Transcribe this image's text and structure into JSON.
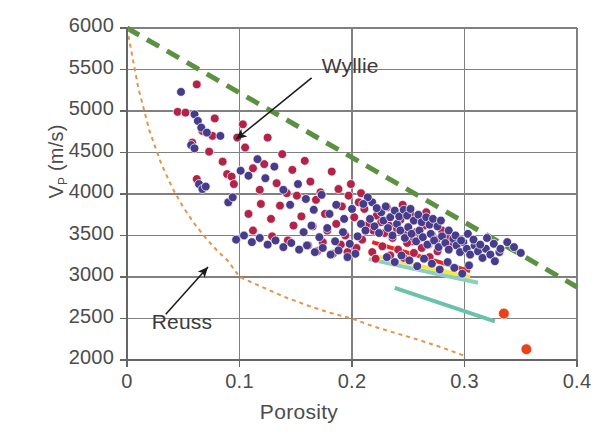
{
  "chart_data": {
    "type": "scatter",
    "title": "",
    "xlabel": "Porosity",
    "ylabel": "V_p (m/s)",
    "ylabel_main": "V",
    "ylabel_sub": "P",
    "ylabel_units": " (m/s)",
    "xlim": [
      0,
      0.4
    ],
    "ylim": [
      2000,
      6000
    ],
    "grid": true,
    "legend": "none",
    "xticks": [
      "0",
      "0.1",
      "0.2",
      "0.3",
      "0.4"
    ],
    "xtick_values": [
      0,
      0.1,
      0.2,
      0.3,
      0.4
    ],
    "yticks": [
      "2000",
      "2500",
      "3000",
      "3500",
      "4000",
      "4500",
      "5000",
      "5500",
      "6000"
    ],
    "ytick_values": [
      2000,
      2500,
      3000,
      3500,
      4000,
      4500,
      5000,
      5500,
      6000
    ],
    "annotations": [
      {
        "label": "Wyllie",
        "text_x": 0.173,
        "text_y": 5520,
        "arrow_to_x": 0.097,
        "arrow_to_y": 4660
      },
      {
        "label": "Reuss",
        "text_x": 0.022,
        "text_y": 2430,
        "arrow_to_x": 0.072,
        "arrow_to_y": 3120
      }
    ],
    "series": [
      {
        "name": "Wyllie time-average",
        "style": "dashed-line",
        "color": "#5a9142",
        "linewidth": 5,
        "dash": "14,9",
        "points": [
          [
            0.0,
            6000
          ],
          [
            0.4,
            2880
          ]
        ]
      },
      {
        "name": "Reuss bound",
        "style": "dotted-line",
        "color": "#E3954E",
        "linewidth": 2,
        "dash": "4,4",
        "points": [
          [
            0.0,
            6000
          ],
          [
            0.01,
            5280
          ],
          [
            0.02,
            4760
          ],
          [
            0.03,
            4380
          ],
          [
            0.04,
            4080
          ],
          [
            0.05,
            3840
          ],
          [
            0.06,
            3640
          ],
          [
            0.07,
            3470
          ],
          [
            0.08,
            3320
          ],
          [
            0.09,
            3190
          ],
          [
            0.1,
            3000
          ],
          [
            0.12,
            2880
          ],
          [
            0.14,
            2760
          ],
          [
            0.16,
            2660
          ],
          [
            0.18,
            2570
          ],
          [
            0.2,
            2500
          ],
          [
            0.22,
            2400
          ],
          [
            0.24,
            2320
          ],
          [
            0.26,
            2240
          ],
          [
            0.28,
            2150
          ],
          [
            0.3,
            2050
          ]
        ]
      },
      {
        "name": "red trend line",
        "style": "solid-line",
        "color": "#E8241C",
        "linewidth": 4,
        "points": [
          [
            0.218,
            3420
          ],
          [
            0.305,
            3070
          ]
        ]
      },
      {
        "name": "yellow trend line",
        "style": "solid-line",
        "color": "#F7E832",
        "linewidth": 4,
        "points": [
          [
            0.218,
            3260
          ],
          [
            0.305,
            3000
          ]
        ]
      },
      {
        "name": "upper teal trend line",
        "style": "solid-line",
        "color": "#8CCFBE",
        "linewidth": 4,
        "points": [
          [
            0.215,
            3215
          ],
          [
            0.312,
            2930
          ]
        ]
      },
      {
        "name": "lower teal trend line",
        "style": "solid-line",
        "color": "#69C2AC",
        "linewidth": 4,
        "points": [
          [
            0.238,
            2870
          ],
          [
            0.327,
            2465
          ]
        ]
      },
      {
        "name": "crimson data points",
        "style": "markers",
        "color": "#B2234A",
        "marker_size": 6,
        "points": [
          [
            0.045,
            4990
          ],
          [
            0.052,
            4980
          ],
          [
            0.062,
            5320
          ],
          [
            0.078,
            4910
          ],
          [
            0.089,
            4240
          ],
          [
            0.093,
            4210
          ],
          [
            0.062,
            4180
          ],
          [
            0.076,
            4700
          ],
          [
            0.098,
            4680
          ],
          [
            0.105,
            4560
          ],
          [
            0.103,
            4840
          ],
          [
            0.118,
            4050
          ],
          [
            0.112,
            4310
          ],
          [
            0.125,
            4680
          ],
          [
            0.122,
            4360
          ],
          [
            0.133,
            4130
          ],
          [
            0.138,
            4480
          ],
          [
            0.142,
            4010
          ],
          [
            0.147,
            4290
          ],
          [
            0.151,
            3980
          ],
          [
            0.119,
            3880
          ],
          [
            0.108,
            3760
          ],
          [
            0.128,
            3700
          ],
          [
            0.136,
            3860
          ],
          [
            0.158,
            4400
          ],
          [
            0.163,
            4150
          ],
          [
            0.168,
            3930
          ],
          [
            0.172,
            4020
          ],
          [
            0.155,
            3730
          ],
          [
            0.148,
            3620
          ],
          [
            0.165,
            3610
          ],
          [
            0.176,
            3760
          ],
          [
            0.182,
            4270
          ],
          [
            0.188,
            4060
          ],
          [
            0.191,
            3850
          ],
          [
            0.197,
            3980
          ],
          [
            0.178,
            3560
          ],
          [
            0.186,
            3640
          ],
          [
            0.194,
            3500
          ],
          [
            0.202,
            3720
          ],
          [
            0.206,
            3900
          ],
          [
            0.211,
            3820
          ],
          [
            0.215,
            3640
          ],
          [
            0.219,
            3560
          ],
          [
            0.222,
            3740
          ],
          [
            0.226,
            3660
          ],
          [
            0.229,
            3530
          ],
          [
            0.233,
            3620
          ],
          [
            0.236,
            3470
          ],
          [
            0.24,
            3580
          ],
          [
            0.243,
            3690
          ],
          [
            0.247,
            3510
          ],
          [
            0.25,
            3600
          ],
          [
            0.254,
            3430
          ],
          [
            0.257,
            3540
          ],
          [
            0.261,
            3470
          ],
          [
            0.264,
            3620
          ],
          [
            0.268,
            3390
          ],
          [
            0.271,
            3510
          ],
          [
            0.275,
            3450
          ],
          [
            0.214,
            3920
          ],
          [
            0.208,
            4010
          ],
          [
            0.199,
            4120
          ],
          [
            0.231,
            3840
          ],
          [
            0.238,
            3790
          ],
          [
            0.245,
            3870
          ],
          [
            0.252,
            3760
          ],
          [
            0.259,
            3700
          ],
          [
            0.266,
            3780
          ],
          [
            0.273,
            3660
          ],
          [
            0.28,
            3560
          ],
          [
            0.285,
            3480
          ],
          [
            0.112,
            3560
          ],
          [
            0.129,
            3490
          ],
          [
            0.143,
            3440
          ],
          [
            0.095,
            4120
          ],
          [
            0.085,
            4390
          ],
          [
            0.073,
            4510
          ],
          [
            0.067,
            4760
          ],
          [
            0.058,
            4620
          ],
          [
            0.161,
            3380
          ],
          [
            0.174,
            3420
          ],
          [
            0.19,
            3390
          ],
          [
            0.204,
            3350
          ],
          [
            0.218,
            3300
          ],
          [
            0.227,
            3370
          ],
          [
            0.241,
            3330
          ],
          [
            0.255,
            3290
          ],
          [
            0.209,
            3450
          ],
          [
            0.196,
            3300
          ],
          [
            0.183,
            3280
          ],
          [
            0.169,
            3310
          ],
          [
            0.249,
            3410
          ],
          [
            0.262,
            3350
          ],
          [
            0.276,
            3310
          ],
          [
            0.288,
            3380
          ],
          [
            0.234,
            3260
          ],
          [
            0.221,
            3220
          ],
          [
            0.246,
            3230
          ],
          [
            0.269,
            3240
          ]
        ]
      },
      {
        "name": "purple data points",
        "style": "markers",
        "color": "#473C8B",
        "marker_size": 6,
        "points": [
          [
            0.048,
            5230
          ],
          [
            0.06,
            4960
          ],
          [
            0.063,
            4880
          ],
          [
            0.066,
            4800
          ],
          [
            0.071,
            4740
          ],
          [
            0.057,
            4590
          ],
          [
            0.06,
            4550
          ],
          [
            0.083,
            4700
          ],
          [
            0.064,
            4120
          ],
          [
            0.067,
            4060
          ],
          [
            0.07,
            4090
          ],
          [
            0.09,
            3900
          ],
          [
            0.094,
            3960
          ],
          [
            0.101,
            4280
          ],
          [
            0.108,
            4220
          ],
          [
            0.116,
            4420
          ],
          [
            0.123,
            4190
          ],
          [
            0.131,
            4330
          ],
          [
            0.139,
            4050
          ],
          [
            0.145,
            3870
          ],
          [
            0.152,
            4120
          ],
          [
            0.159,
            3940
          ],
          [
            0.166,
            3810
          ],
          [
            0.173,
            3990
          ],
          [
            0.18,
            3760
          ],
          [
            0.186,
            3870
          ],
          [
            0.193,
            3700
          ],
          [
            0.2,
            3820
          ],
          [
            0.157,
            3540
          ],
          [
            0.164,
            3620
          ],
          [
            0.171,
            3480
          ],
          [
            0.178,
            3590
          ],
          [
            0.185,
            3430
          ],
          [
            0.192,
            3540
          ],
          [
            0.198,
            3400
          ],
          [
            0.205,
            3490
          ],
          [
            0.208,
            3640
          ],
          [
            0.212,
            3560
          ],
          [
            0.216,
            3700
          ],
          [
            0.22,
            3610
          ],
          [
            0.224,
            3530
          ],
          [
            0.228,
            3680
          ],
          [
            0.232,
            3590
          ],
          [
            0.236,
            3500
          ],
          [
            0.24,
            3640
          ],
          [
            0.243,
            3560
          ],
          [
            0.247,
            3470
          ],
          [
            0.25,
            3600
          ],
          [
            0.253,
            3520
          ],
          [
            0.257,
            3430
          ],
          [
            0.26,
            3560
          ],
          [
            0.263,
            3480
          ],
          [
            0.267,
            3390
          ],
          [
            0.27,
            3520
          ],
          [
            0.273,
            3440
          ],
          [
            0.277,
            3360
          ],
          [
            0.28,
            3490
          ],
          [
            0.283,
            3410
          ],
          [
            0.286,
            3330
          ],
          [
            0.29,
            3460
          ],
          [
            0.293,
            3380
          ],
          [
            0.296,
            3300
          ],
          [
            0.299,
            3420
          ],
          [
            0.302,
            3340
          ],
          [
            0.305,
            3270
          ],
          [
            0.309,
            3380
          ],
          [
            0.312,
            3310
          ],
          [
            0.316,
            3230
          ],
          [
            0.319,
            3340
          ],
          [
            0.323,
            3270
          ],
          [
            0.327,
            3190
          ],
          [
            0.331,
            3300
          ],
          [
            0.226,
            3780
          ],
          [
            0.23,
            3850
          ],
          [
            0.234,
            3720
          ],
          [
            0.238,
            3800
          ],
          [
            0.242,
            3730
          ],
          [
            0.246,
            3810
          ],
          [
            0.249,
            3740
          ],
          [
            0.252,
            3820
          ],
          [
            0.218,
            3900
          ],
          [
            0.222,
            3830
          ],
          [
            0.214,
            3960
          ],
          [
            0.21,
            3880
          ],
          [
            0.255,
            3680
          ],
          [
            0.259,
            3750
          ],
          [
            0.262,
            3660
          ],
          [
            0.266,
            3720
          ],
          [
            0.269,
            3630
          ],
          [
            0.272,
            3700
          ],
          [
            0.276,
            3610
          ],
          [
            0.279,
            3680
          ],
          [
            0.231,
            3240
          ],
          [
            0.238,
            3180
          ],
          [
            0.244,
            3260
          ],
          [
            0.251,
            3200
          ],
          [
            0.258,
            3130
          ],
          [
            0.264,
            3220
          ],
          [
            0.271,
            3160
          ],
          [
            0.278,
            3090
          ],
          [
            0.285,
            3180
          ],
          [
            0.291,
            3110
          ],
          [
            0.298,
            3040
          ],
          [
            0.304,
            3140
          ],
          [
            0.203,
            3280
          ],
          [
            0.196,
            3240
          ],
          [
            0.188,
            3320
          ],
          [
            0.181,
            3270
          ],
          [
            0.174,
            3350
          ],
          [
            0.167,
            3300
          ],
          [
            0.16,
            3380
          ],
          [
            0.153,
            3330
          ],
          [
            0.146,
            3410
          ],
          [
            0.139,
            3360
          ],
          [
            0.132,
            3440
          ],
          [
            0.125,
            3390
          ],
          [
            0.118,
            3470
          ],
          [
            0.111,
            3420
          ],
          [
            0.104,
            3500
          ],
          [
            0.097,
            3450
          ],
          [
            0.286,
            3560
          ],
          [
            0.292,
            3500
          ],
          [
            0.297,
            3440
          ],
          [
            0.303,
            3520
          ],
          [
            0.308,
            3450
          ],
          [
            0.314,
            3390
          ],
          [
            0.32,
            3470
          ],
          [
            0.326,
            3400
          ],
          [
            0.332,
            3340
          ],
          [
            0.338,
            3420
          ],
          [
            0.344,
            3360
          ],
          [
            0.35,
            3290
          ]
        ]
      },
      {
        "name": "orange outlier points",
        "style": "markers",
        "color": "#E8431A",
        "marker_size": 8,
        "points": [
          [
            0.335,
            2560
          ],
          [
            0.355,
            2130
          ]
        ]
      }
    ]
  },
  "style": {
    "grid_color": "#808080",
    "axis_color": "#666666",
    "tick_text_color": "#4c4c4c",
    "annotation_color": "#3b3b3b",
    "background": "#ffffff"
  }
}
